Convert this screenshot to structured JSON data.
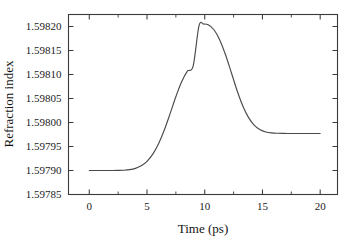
{
  "chart_data": {
    "type": "line",
    "title": "",
    "subtitle": "",
    "xlabel": "Time (ps)",
    "ylabel": "Refraction index",
    "xlim": [
      -1.8,
      21.5
    ],
    "ylim": [
      1.59785,
      1.598225
    ],
    "grid": false,
    "legend": null,
    "xticks": [
      0,
      5,
      10,
      15,
      20
    ],
    "xtick_labels": [
      "0",
      "5",
      "10",
      "15",
      "20"
    ],
    "xticks_minor": [
      2.5,
      7.5,
      12.5,
      17.5
    ],
    "yticks": [
      1.59785,
      1.5979,
      1.59795,
      1.598,
      1.59805,
      1.5981,
      1.59815,
      1.5982
    ],
    "ytick_labels": [
      "1.59785",
      "1.59790",
      "1.59795",
      "1.59800",
      "1.59805",
      "1.59810",
      "1.59815",
      "1.59820"
    ],
    "series": [
      {
        "name": "refraction index",
        "baseline": 1.5979,
        "peak_value": 1.598205,
        "peak_time": 9.9,
        "fwhm": 5.0,
        "x": [
          0.0,
          0.5,
          1.0,
          1.5,
          2.0,
          2.5,
          3.0,
          3.5,
          4.0,
          4.5,
          5.0,
          5.5,
          6.0,
          6.5,
          7.0,
          7.5,
          8.0,
          8.5,
          9.0,
          9.5,
          9.9,
          10.3,
          10.8,
          11.3,
          11.8,
          12.3,
          12.8,
          13.3,
          13.8,
          14.3,
          14.8,
          15.3,
          15.8,
          16.3,
          16.8,
          17.3,
          17.8,
          18.3,
          18.8,
          19.3,
          19.8,
          20.0
        ],
        "y": [
          1.5979,
          1.5979,
          1.5979,
          1.5979,
          1.5979,
          1.5979002,
          1.5979006,
          1.5979018,
          1.5979045,
          1.5979098,
          1.5979192,
          1.5979341,
          1.5979558,
          1.5979845,
          1.5980185,
          1.5980537,
          1.5980848,
          1.5981069,
          1.5981181,
          1.5982015,
          1.598205,
          1.5982035,
          1.5981932,
          1.5981721,
          1.5981412,
          1.5981042,
          1.5980668,
          1.5980344,
          1.5980102,
          1.5979942,
          1.5979849,
          1.5979803,
          1.5979783,
          1.5979775,
          1.5979772,
          1.5979771,
          1.597977,
          1.597977,
          1.597977,
          1.597977,
          1.597977,
          1.597977
        ]
      }
    ]
  },
  "axes": {
    "x_title": "Time (ps)",
    "y_title": "Refraction index"
  }
}
